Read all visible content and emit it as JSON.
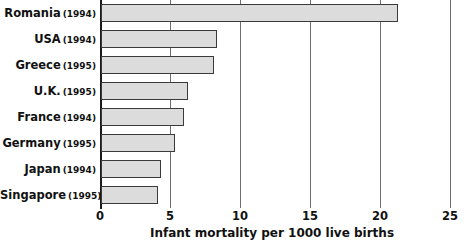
{
  "chart_data": {
    "type": "bar",
    "orientation": "horizontal",
    "title": "",
    "xlabel": "Infant mortality per 1000 live births",
    "ylabel": "",
    "xlim": [
      0,
      25
    ],
    "xticks": [
      0,
      5,
      10,
      15,
      20,
      25
    ],
    "grid": true,
    "legend": false,
    "categories": [
      "Romania (1994)",
      "USA (1994)",
      "Greece (1995)",
      "U.K. (1995)",
      "France (1994)",
      "Germany (1995)",
      "Japan (1994)",
      "Singapore (1995)"
    ],
    "values": [
      21.2,
      8.3,
      8.1,
      6.2,
      5.9,
      5.3,
      4.3,
      4.1
    ],
    "bars": [
      {
        "country": "Romania",
        "year": "(1994)",
        "value": 21.2
      },
      {
        "country": "USA",
        "year": "(1994)",
        "value": 8.3
      },
      {
        "country": "Greece",
        "year": "(1995)",
        "value": 8.1
      },
      {
        "country": "U.K.",
        "year": "(1995)",
        "value": 6.2
      },
      {
        "country": "France",
        "year": "(1994)",
        "value": 5.9
      },
      {
        "country": "Germany",
        "year": "(1995)",
        "value": 5.3
      },
      {
        "country": "Japan",
        "year": "(1994)",
        "value": 4.3
      },
      {
        "country": "Singapore",
        "year": "(1995)",
        "value": 4.1
      }
    ],
    "colors": {
      "bar_fill": "#dcdcdc",
      "bar_border": "#3a3a3a",
      "gridline": "#6e6e6e",
      "axis": "#1a1a1a",
      "text": "#111111",
      "background": "#ffffff"
    }
  }
}
